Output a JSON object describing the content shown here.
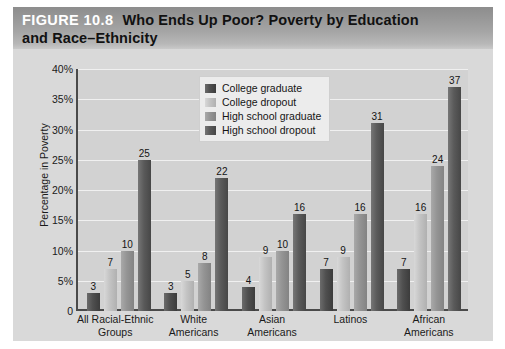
{
  "figure": {
    "number_label": "FIGURE 10.8",
    "title_line1": "Who Ends Up Poor? Poverty by Education",
    "title_line2": "and Race–Ethnicity"
  },
  "chart_data": {
    "type": "bar",
    "title": "Who Ends Up Poor? Poverty by Education and Race–Ethnicity",
    "xlabel": "",
    "ylabel": "Percentage in Poverty",
    "ylim": [
      0,
      40
    ],
    "grid": true,
    "legend_position": "top-center-inside",
    "ytick_labels": [
      "0",
      "5%",
      "10%",
      "15%",
      "20%",
      "25%",
      "30%",
      "35%",
      "40%"
    ],
    "ytick_values": [
      0,
      5,
      10,
      15,
      20,
      25,
      30,
      35,
      40
    ],
    "categories": [
      "All Racial-Ethnic Groups",
      "White Americans",
      "Asian Americans",
      "Latinos",
      "African Americans"
    ],
    "category_lines": [
      [
        "All Racial-Ethnic",
        "Groups"
      ],
      [
        "White",
        "Americans"
      ],
      [
        "Asian",
        "Americans"
      ],
      [
        "Latinos",
        ""
      ],
      [
        "African",
        "Americans"
      ]
    ],
    "series": [
      {
        "name": "College graduate",
        "color": "#4f4f4f",
        "values": [
          3,
          3,
          4,
          7,
          7
        ]
      },
      {
        "name": "College dropout",
        "color": "#c3c3c3",
        "values": [
          7,
          5,
          9,
          9,
          16
        ]
      },
      {
        "name": "High school graduate",
        "color": "#949494",
        "values": [
          10,
          8,
          10,
          16,
          24
        ]
      },
      {
        "name": "High school dropout",
        "color": "#5a5a5a",
        "values": [
          25,
          22,
          16,
          31,
          37
        ]
      }
    ]
  },
  "colors": {
    "banner_start": "#8d8d8d",
    "banner_end": "#c9c9c9",
    "chart_background": "#d9d9d9",
    "plot_background": "#d2d2d2",
    "axis": "#4a4a4a",
    "gridline": "#f0f0f0"
  }
}
